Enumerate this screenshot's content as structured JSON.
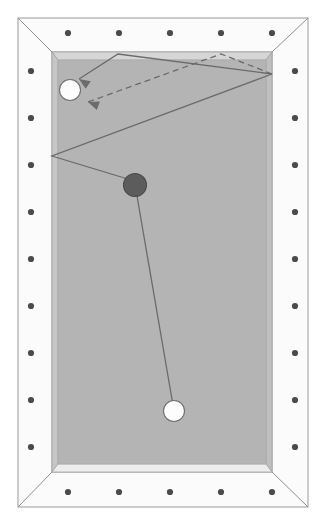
{
  "colors": {
    "page_background": "#ffffff",
    "rail_top": "#fbfbfb",
    "rail_outline": "#9a9a9a",
    "rail_shadow": "#e7e7e7",
    "cushion_bevel": "#c9c9c9",
    "cushion_bevel_dark": "#bdbdbd",
    "cloth": "#b4b4b4",
    "sight_dot": "#4b4b4b",
    "ball_white_fill": "#fdfdfd",
    "ball_white_stroke": "#6f6f6f",
    "ball_dark_fill": "#5c5c5c",
    "ball_dark_stroke": "#4a4a4a",
    "trajectory_line": "#6b6b6b"
  },
  "table": {
    "outer_rail": {
      "x": 18,
      "y": 18,
      "width": 290,
      "height": 489
    },
    "cloth": {
      "x": 52,
      "y": 52,
      "width": 220,
      "height": 420
    },
    "rail_width": 34,
    "corner_miter": true
  },
  "sight_dots": {
    "radius": 3.1,
    "top": [
      {
        "x": 68,
        "y": 33
      },
      {
        "x": 119,
        "y": 33
      },
      {
        "x": 170,
        "y": 33
      },
      {
        "x": 221,
        "y": 33
      },
      {
        "x": 272,
        "y": 33
      }
    ],
    "bottom": [
      {
        "x": 68,
        "y": 492
      },
      {
        "x": 119,
        "y": 492
      },
      {
        "x": 170,
        "y": 492
      },
      {
        "x": 221,
        "y": 492
      },
      {
        "x": 272,
        "y": 492
      }
    ],
    "left": [
      {
        "x": 31,
        "y": 71
      },
      {
        "x": 31,
        "y": 118
      },
      {
        "x": 31,
        "y": 165
      },
      {
        "x": 31,
        "y": 212
      },
      {
        "x": 31,
        "y": 259
      },
      {
        "x": 31,
        "y": 306
      },
      {
        "x": 31,
        "y": 353
      },
      {
        "x": 31,
        "y": 400
      },
      {
        "x": 31,
        "y": 447
      }
    ],
    "right": [
      {
        "x": 295,
        "y": 71
      },
      {
        "x": 295,
        "y": 118
      },
      {
        "x": 295,
        "y": 165
      },
      {
        "x": 295,
        "y": 212
      },
      {
        "x": 295,
        "y": 259
      },
      {
        "x": 295,
        "y": 306
      },
      {
        "x": 295,
        "y": 353
      },
      {
        "x": 295,
        "y": 400
      },
      {
        "x": 295,
        "y": 447
      }
    ]
  },
  "balls": [
    {
      "name": "target-ball-white-upper",
      "type": "white",
      "cx": 70,
      "cy": 90,
      "r": 10.5,
      "label": "Object ball (upper left)"
    },
    {
      "name": "object-ball-dark",
      "type": "dark",
      "cx": 135,
      "cy": 185,
      "r": 11.5,
      "label": "Object ball (dark)"
    },
    {
      "name": "cue-ball-white-lower",
      "type": "white",
      "cx": 174,
      "cy": 411,
      "r": 10.5,
      "label": "Cue ball"
    }
  ],
  "trajectories": [
    {
      "name": "cue-to-object-line",
      "style": "solid",
      "arrow": false,
      "points": [
        {
          "x": 174,
          "y": 411
        },
        {
          "x": 137,
          "y": 196
        }
      ]
    },
    {
      "name": "object-ball-bank-path",
      "style": "solid",
      "arrow": true,
      "points": [
        {
          "x": 141,
          "y": 183
        },
        {
          "x": 52,
          "y": 156
        },
        {
          "x": 272,
          "y": 74
        },
        {
          "x": 118,
          "y": 54
        },
        {
          "x": 79,
          "y": 79
        }
      ]
    },
    {
      "name": "alternate-bank-path",
      "style": "dashed",
      "arrow": true,
      "points": [
        {
          "x": 272,
          "y": 74
        },
        {
          "x": 221,
          "y": 54
        },
        {
          "x": 88,
          "y": 102
        }
      ]
    }
  ],
  "arrowheads": [
    {
      "name": "solid-path-arrowhead",
      "x": 79,
      "y": 79,
      "angle": 213
    },
    {
      "name": "dashed-path-arrowhead",
      "x": 88,
      "y": 102,
      "angle": 200
    }
  ]
}
